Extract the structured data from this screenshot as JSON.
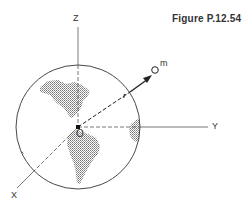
{
  "figure": {
    "title": "Figure P.12.54"
  },
  "labels": {
    "z_axis": "Z",
    "y_axis": "Y",
    "x_axis": "X",
    "origin": "O",
    "mass": "m",
    "position_vector": "r"
  },
  "colors": {
    "line": "#333333",
    "land": "#9a9a9a",
    "background": "#ffffff"
  }
}
